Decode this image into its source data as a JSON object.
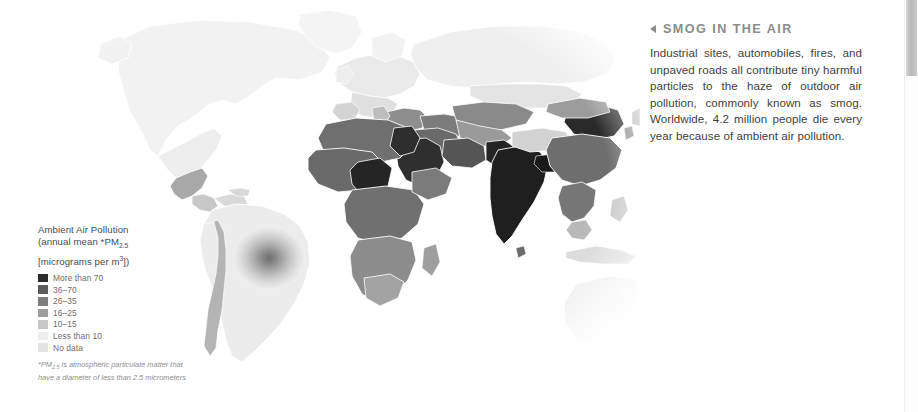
{
  "article": {
    "marker_icon": "left-triangle-icon",
    "title": "SMOG IN THE AIR",
    "body": "Industrial sites, automobiles, fires, and unpaved roads all contribute tiny harmful particles to the haze of outdoor air pollution, commonly known as smog. Worldwide, 4.2 million people die every year because of ambient air pollution."
  },
  "legend": {
    "title_line1": "Ambient Air Pollution",
    "title_line2_pre": "(annual mean *PM",
    "title_line2_sub": "2.5",
    "title_line3_pre": "[micrograms per m",
    "title_line3_sup": "3",
    "title_line3_post": "])",
    "footnote_pre": "*PM",
    "footnote_sub": "2.5",
    "footnote_post": " is atmospheric particulate matter that have a diameter of less than 2.5 micrometers",
    "entries": [
      {
        "label": "More than 70",
        "color": "#2b2b2b"
      },
      {
        "label": "36–70",
        "color": "#5c5c5c"
      },
      {
        "label": "26–35",
        "color": "#7e7e7e"
      },
      {
        "label": "16–25",
        "color": "#9d9d9d"
      },
      {
        "label": "10–15",
        "color": "#c7c7c7"
      },
      {
        "label": "Less than 10",
        "color": "#eeeeee"
      },
      {
        "label": "No data",
        "color": "#e3e3e3"
      }
    ]
  },
  "map": {
    "title": "World ambient air pollution choropleth",
    "projection": "robinson-like globe",
    "background": "#ffffff",
    "border_color": "#ffffff",
    "regions": [
      {
        "name": "north-america",
        "level": "Less than 10"
      },
      {
        "name": "greenland",
        "level": "Less than 10"
      },
      {
        "name": "mexico",
        "level": "16–25"
      },
      {
        "name": "central-america",
        "level": "10–15"
      },
      {
        "name": "south-america",
        "level": "Less than 10"
      },
      {
        "name": "brazil-hotspot",
        "level": "26–35"
      },
      {
        "name": "chile-peru-coast",
        "level": "16–25"
      },
      {
        "name": "europe-west",
        "level": "10–15"
      },
      {
        "name": "balkans-turkey",
        "level": "26–35"
      },
      {
        "name": "north-africa",
        "level": "36–70"
      },
      {
        "name": "egypt",
        "level": "More than 70"
      },
      {
        "name": "west-africa",
        "level": "36–70"
      },
      {
        "name": "nigeria-cameroon",
        "level": "More than 70"
      },
      {
        "name": "central-africa",
        "level": "36–70"
      },
      {
        "name": "southern-africa",
        "level": "26–35"
      },
      {
        "name": "arabian-peninsula",
        "level": "More than 70"
      },
      {
        "name": "middle-east",
        "level": "36–70"
      },
      {
        "name": "india",
        "level": "More than 70"
      },
      {
        "name": "pakistan",
        "level": "More than 70"
      },
      {
        "name": "himalaya-tibet",
        "level": "10–15"
      },
      {
        "name": "china-north",
        "level": "More than 70"
      },
      {
        "name": "china-central",
        "level": "36–70"
      },
      {
        "name": "mongolia",
        "level": "26–35"
      },
      {
        "name": "russia-siberia",
        "level": "Less than 10"
      },
      {
        "name": "central-asia",
        "level": "26–35"
      },
      {
        "name": "southeast-asia",
        "level": "16–25"
      },
      {
        "name": "indonesia",
        "level": "10–15"
      },
      {
        "name": "australia",
        "level": "Less than 10"
      },
      {
        "name": "new-zealand",
        "level": "Less than 10"
      }
    ]
  },
  "scrollbar": {
    "orientation": "vertical",
    "thumb_top_px": 0,
    "thumb_height_px": 76
  }
}
